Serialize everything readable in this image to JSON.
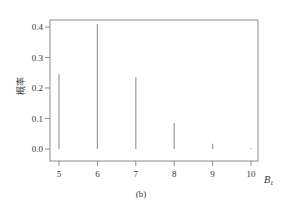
{
  "chart_data": {
    "type": "bar",
    "style": "stem",
    "title": "",
    "caption": "(b)",
    "xlabel": "B",
    "xlabel_subscript": "t",
    "ylabel": "概率",
    "x": [
      5,
      6,
      7,
      8,
      9,
      10
    ],
    "categories": [
      "5",
      "6",
      "7",
      "8",
      "9",
      "10"
    ],
    "values": [
      0.245,
      0.41,
      0.235,
      0.085,
      0.017,
      0.003
    ],
    "yticks": [
      0.0,
      0.1,
      0.2,
      0.3,
      0.4
    ],
    "ytick_labels": [
      "0.0",
      "0.1",
      "0.2",
      "0.3",
      "0.4"
    ],
    "xticks": [
      5,
      6,
      7,
      8,
      9,
      10
    ],
    "ylim": [
      -0.04,
      0.42
    ],
    "xlim": [
      4.77,
      10.18
    ],
    "grid": false,
    "legend": null,
    "colors": {
      "bar": "#9a9a9a",
      "axis": "#8c8c8c",
      "text": "#333333"
    }
  }
}
